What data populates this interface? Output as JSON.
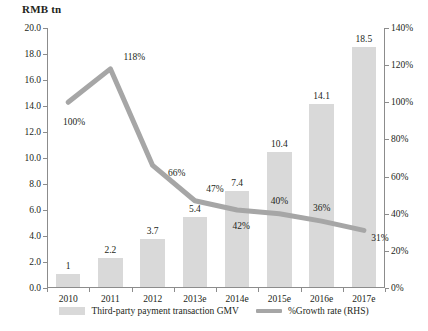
{
  "chart_data": {
    "type": "bar",
    "title": "RMB tn",
    "xlabel": "",
    "ylabel": "RMB tn",
    "categories": [
      "2010",
      "2011",
      "2012",
      "2013e",
      "2014e",
      "2015e",
      "2016e",
      "2017e"
    ],
    "series": [
      {
        "name": "Third-party payment transaction GMV",
        "type": "bar",
        "axis": "left",
        "color": "#d9d9d9",
        "values": [
          1,
          2.2,
          3.7,
          5.4,
          7.4,
          10.4,
          14.1,
          18.5
        ],
        "labels": [
          "1",
          "2.2",
          "3.7",
          "5.4",
          "7.4",
          "10.4",
          "14.1",
          "18.5"
        ]
      },
      {
        "name": "%Growth rate (RHS)",
        "type": "line",
        "axis": "right",
        "color": "#a6a6a6",
        "values": [
          100,
          118,
          66,
          47,
          42,
          40,
          36,
          31
        ],
        "labels": [
          "100%",
          "118%",
          "66%",
          "47%",
          "42%",
          "40%",
          "36%",
          "31%"
        ]
      }
    ],
    "ylim": [
      0,
      20
    ],
    "yticks": [
      0,
      2,
      4,
      6,
      8,
      10,
      12,
      14,
      16,
      18,
      20
    ],
    "ytick_labels": [
      "0.0",
      "2.0",
      "4.0",
      "6.0",
      "8.0",
      "10.0",
      "12.0",
      "14.0",
      "16.0",
      "18.0",
      "20.0"
    ],
    "y2lim": [
      0,
      140
    ],
    "y2ticks": [
      0,
      20,
      40,
      60,
      80,
      100,
      120,
      140
    ],
    "y2tick_labels": [
      "0%",
      "20%",
      "40%",
      "60%",
      "80%",
      "100%",
      "120%",
      "140%"
    ],
    "grid": false,
    "legend_position": "bottom"
  },
  "legend": {
    "bar_label": "Third-party payment transaction GMV",
    "line_label": "%Growth rate (RHS)"
  }
}
